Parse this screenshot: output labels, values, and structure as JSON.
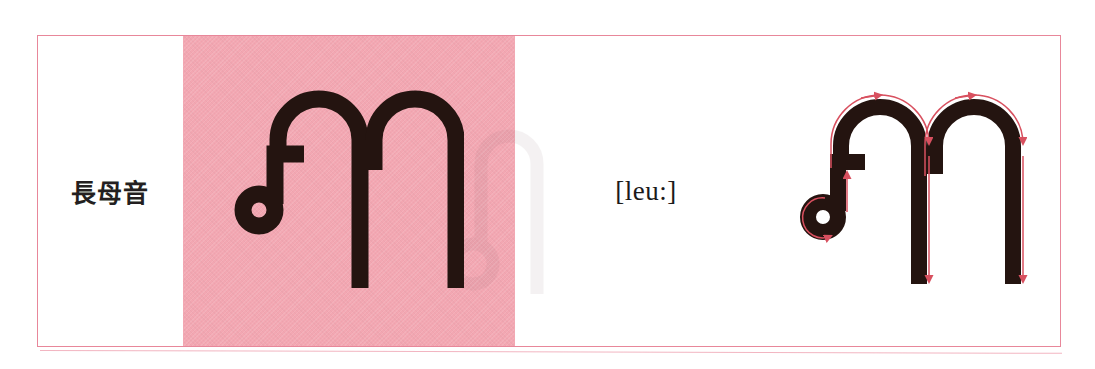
{
  "card": {
    "type": "thai-script-flashcard-row",
    "frame_border_color": "#e8879a",
    "background_color": "#ffffff"
  },
  "label_cell": {
    "name": "vowel-category-label",
    "text": "長母音",
    "meaning_note": "long vowel",
    "text_color": "#231f20"
  },
  "glyph_cell": {
    "name": "thai-letter-display",
    "character": "ฦๅ",
    "character_parts": [
      "ฦ",
      "ๅ"
    ],
    "panel_color": "#f3a7b2",
    "glyph_color": "#241410"
  },
  "phonetic_cell": {
    "name": "phonetic-transcription",
    "text": "[leu:]",
    "text_color": "#1c1a1a"
  },
  "stroke_cell": {
    "name": "stroke-order-diagram",
    "character": "ฦๅ",
    "arrow_color": "#d8505f",
    "glyph_color": "#241410",
    "stroke_count": 2,
    "strokes": [
      {
        "index": 1,
        "name": "stroke-1-loop-and-stem",
        "belongs_to": "ฦ",
        "direction": "start at loop, circle counter-clockwise, up, over the top arch, then straight down"
      },
      {
        "index": 2,
        "name": "stroke-2-arch-and-stem",
        "belongs_to": "ๅ",
        "direction": "start at left shoulder, over the top arch to the right, then straight down"
      }
    ]
  }
}
